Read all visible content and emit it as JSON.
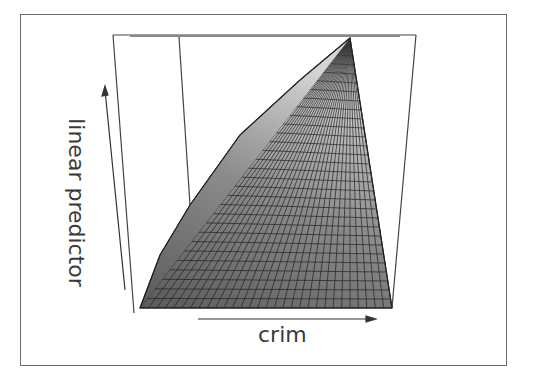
{
  "chart_data": {
    "type": "surface",
    "title": "",
    "xlabel": "crim",
    "ylabel": "linear predictor",
    "zlabel": "",
    "grid": "wireframe mesh with gray shading",
    "axes": {
      "x": {
        "label": "crim",
        "arrow": "right"
      },
      "y": {
        "label": "linear predictor",
        "arrow": "up"
      }
    },
    "tick_labels": [],
    "surface_shape": {
      "front_left_low": true,
      "back_right_peak": true,
      "approx_mesh_lines": 30
    }
  },
  "colors": {
    "surface_fill": "#8a8a8a",
    "surface_light": "#c8c8c8",
    "mesh_line": "#1e1e1e",
    "box_line": "#444444",
    "frame": "#6b6b6b",
    "text": "#3a3a3a"
  }
}
